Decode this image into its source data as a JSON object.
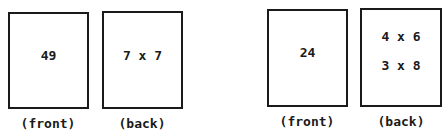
{
  "flashcards": [
    {
      "front": {
        "value": "49",
        "label": "(front)"
      },
      "back": {
        "lines": [
          "7 x 7"
        ],
        "label": "(back)"
      }
    },
    {
      "front": {
        "value": "24",
        "label": "(front)"
      },
      "back": {
        "lines": [
          "4 x 6",
          "3 x 8"
        ],
        "label": "(back)"
      }
    }
  ]
}
